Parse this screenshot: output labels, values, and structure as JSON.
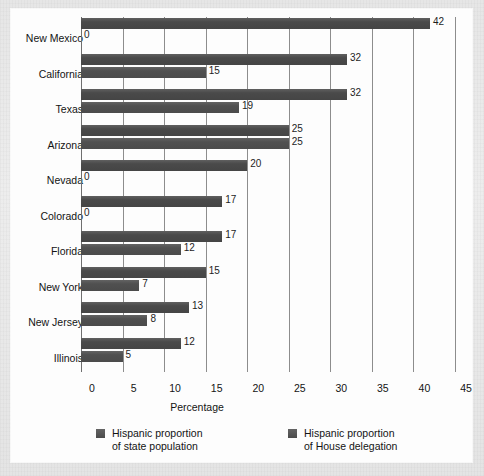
{
  "chart_data": {
    "type": "bar",
    "orientation": "horizontal",
    "title": "",
    "xlabel": "Percentage",
    "ylabel": "",
    "xlim": [
      0,
      45
    ],
    "xticks": [
      0,
      5,
      10,
      15,
      20,
      25,
      30,
      35,
      40,
      45
    ],
    "grid": true,
    "legend_position": "bottom",
    "categories": [
      "New Mexico",
      "California",
      "Texas",
      "Arizona",
      "Nevada",
      "Colorado",
      "Florida",
      "New York",
      "New Jersey",
      "Illinois"
    ],
    "series": [
      {
        "name": "Hispanic proportion\nof state population",
        "color": "#4a4a4a",
        "values": [
          42,
          32,
          32,
          25,
          20,
          17,
          17,
          15,
          13,
          12
        ]
      },
      {
        "name": "Hispanic proportion\nof House delegation",
        "color": "#515151",
        "values": [
          0,
          15,
          19,
          25,
          0,
          0,
          12,
          7,
          8,
          5
        ]
      }
    ]
  },
  "axis": {
    "x_tick_labels": [
      "0",
      "5",
      "10",
      "15",
      "20",
      "25",
      "30",
      "35",
      "40",
      "45"
    ],
    "x_axis_title": "Percentage"
  },
  "legend": {
    "items": [
      {
        "label": "Hispanic proportion\nof state population",
        "swatch_color": "#4a4a4a"
      },
      {
        "label": "Hispanic proportion\nof House delegation",
        "swatch_color": "#515151"
      }
    ]
  }
}
